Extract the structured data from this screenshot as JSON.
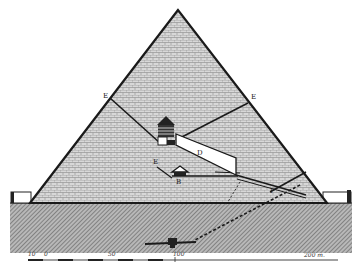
{
  "figure": {
    "labels": {
      "E_left": "E",
      "E_right": "E",
      "E_lower": "E",
      "D": "D",
      "B": "B",
      "F": "F"
    },
    "scale_bar": {
      "left_tick": "10",
      "zero": "0",
      "mid": "50",
      "hundred": "100",
      "end": "200 m."
    },
    "colors": {
      "line": "#1a1a1a",
      "masonry": "#bdbdbd",
      "ground": "#9a9a9a",
      "background": "#ffffff"
    }
  }
}
